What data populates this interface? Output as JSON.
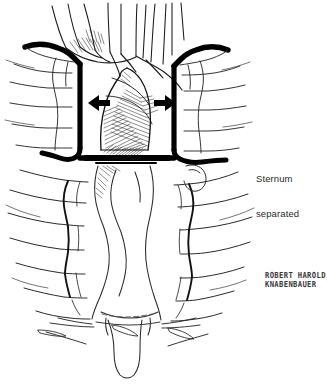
{
  "figure": {
    "background_color": "#ffffff",
    "ink_color": "#000000",
    "text_color": "#2b2b2b"
  },
  "annotations": {
    "sternum_label": {
      "line_1": "Sternum",
      "line_2": "separated"
    }
  },
  "signature": {
    "line_1": "ROBERT HAROLD",
    "line_2": "KNABENBAUER"
  },
  "arrows": {
    "left_arrow_direction": "left",
    "right_arrow_direction": "right",
    "count": 2
  },
  "anatomy": {
    "parts": [
      "sternum-left-half",
      "sternum-right-half",
      "aortic-arch",
      "brachiocephalic-vessels",
      "rib-cage-left",
      "rib-cage-right",
      "costal-cartilage",
      "xiphoid-process",
      "mediastinum"
    ]
  }
}
